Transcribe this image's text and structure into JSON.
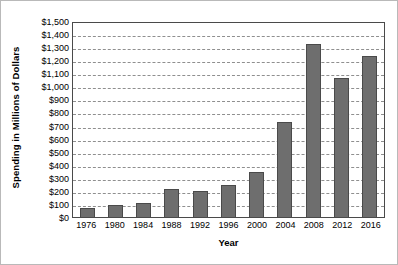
{
  "chart_data": {
    "type": "bar",
    "title": "",
    "xlabel": "Year",
    "ylabel": "Spending in Millions of Dollars",
    "categories": [
      "1976",
      "1980",
      "1984",
      "1988",
      "1992",
      "1996",
      "2000",
      "2004",
      "2008",
      "2012",
      "2016"
    ],
    "values": [
      70,
      95,
      105,
      215,
      200,
      245,
      345,
      725,
      1325,
      1065,
      1235
    ],
    "ylim": [
      0,
      1500
    ],
    "ytick_step": 100,
    "ytick_labels": [
      "$0",
      "$100",
      "$200",
      "$300",
      "$400",
      "$500",
      "$600",
      "$700",
      "$800",
      "$900",
      "$1,000",
      "$1,100",
      "$1,200",
      "$1,300",
      "$1,400",
      "$1,500"
    ],
    "ytick_values": [
      0,
      100,
      200,
      300,
      400,
      500,
      600,
      700,
      800,
      900,
      1000,
      1100,
      1200,
      1300,
      1400,
      1500
    ],
    "grid": true,
    "grid_style": "dashed",
    "legend": null,
    "legend_position": "none",
    "bar_color": "#6e6e6e",
    "bar_edge_color": "#4a4a4a",
    "grid_color": "#8f8f8f",
    "axis_color": "#4a4a4a",
    "frame_color": "#b9b9b9",
    "background": "#ffffff"
  }
}
